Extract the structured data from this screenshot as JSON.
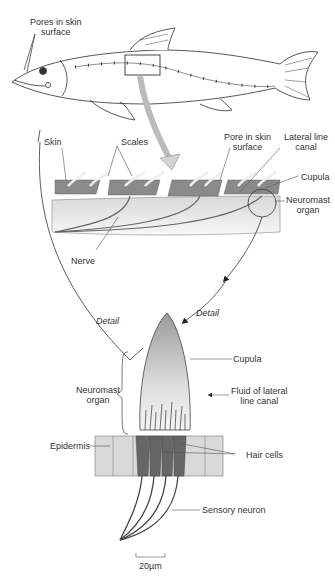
{
  "figure": {
    "colors": {
      "line": "#444444",
      "scale": "#8a8a8a",
      "canal": "#e2e2e2",
      "arrow_fill": "#d4d4d4",
      "cells": "#666666",
      "epidermis": "#d9d9d9"
    }
  },
  "panel_fish": {
    "labels": {
      "pores_line1": "Pores in skin",
      "pores_line2": "surface"
    }
  },
  "panel_section": {
    "labels": {
      "skin": "Skin",
      "scales": "Scales",
      "pore_line1": "Pore in skin",
      "pore_line2": "surface",
      "canal_line1": "Lateral line",
      "canal_line2": "canal",
      "cupula": "Cupula",
      "neuromast_line1": "Neuromast",
      "neuromast_line2": "organ",
      "nerve": "Nerve"
    }
  },
  "panel_detail": {
    "labels": {
      "detail_left": "Detail",
      "detail_right": "Detail",
      "cupula": "Cupula",
      "neuromast_line1": "Neuromast",
      "neuromast_line2": "organ",
      "fluid_line1": "Fluid of lateral",
      "fluid_line2": "line canal",
      "epidermis": "Epidermis",
      "hair_cells": "Hair cells",
      "sensory_neuron": "Sensory neuron",
      "scale_bar": "20µm"
    }
  }
}
